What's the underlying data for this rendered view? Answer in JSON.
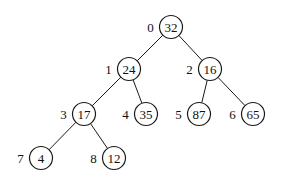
{
  "diagram": {
    "type": "binary-heap-tree",
    "nodes": [
      {
        "index": "0",
        "value": "32",
        "x": 171,
        "y": 27
      },
      {
        "index": "1",
        "value": "24",
        "x": 129,
        "y": 69
      },
      {
        "index": "2",
        "value": "16",
        "x": 210,
        "y": 69
      },
      {
        "index": "3",
        "value": "17",
        "x": 84,
        "y": 114
      },
      {
        "index": "4",
        "value": "35",
        "x": 146,
        "y": 114
      },
      {
        "index": "5",
        "value": "87",
        "x": 199,
        "y": 114
      },
      {
        "index": "6",
        "value": "65",
        "x": 253,
        "y": 114
      },
      {
        "index": "7",
        "value": "4",
        "x": 41,
        "y": 158
      },
      {
        "index": "8",
        "value": "12",
        "x": 114,
        "y": 158
      }
    ],
    "edges": [
      [
        0,
        1
      ],
      [
        0,
        2
      ],
      [
        1,
        3
      ],
      [
        1,
        4
      ],
      [
        2,
        5
      ],
      [
        2,
        6
      ],
      [
        3,
        7
      ],
      [
        3,
        8
      ]
    ],
    "colors": {
      "stroke": "#1a1a1a",
      "background": "#ffffff"
    }
  }
}
